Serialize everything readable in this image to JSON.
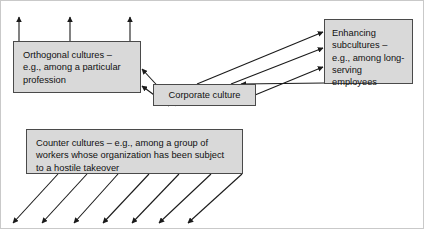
{
  "diagram": {
    "type": "relationship-diagram",
    "canvas": {
      "width": 424,
      "height": 229,
      "background": "#ffffff",
      "border_color": "#c9c9c9"
    },
    "node_style": {
      "fill": "#d9d9d9",
      "stroke": "#4a4a4a",
      "text_color": "#111111"
    },
    "arrow_color": "#1a1a1a",
    "nodes": [
      {
        "id": "orthogonal",
        "label": "Orthogonal cultures –\ne.g., among a particular\nprofession",
        "x": 12,
        "y": 40,
        "w": 128,
        "h": 52
      },
      {
        "id": "corporate",
        "label": "Corporate culture",
        "x": 152,
        "y": 83,
        "w": 103,
        "h": 22
      },
      {
        "id": "enhancing",
        "label": "Enhancing\nsubcultures  –\ne.g., among long-\nserving employees",
        "x": 323,
        "y": 18,
        "w": 89,
        "h": 65
      },
      {
        "id": "counter",
        "label": "Counter cultures – e.g., among a group of\nworkers whose organization has been subject\nto a hostile takeover",
        "x": 25,
        "y": 128,
        "w": 217,
        "h": 45
      }
    ],
    "edges": [
      {
        "from": "orthogonal",
        "to": "outside-up",
        "count": 3,
        "direction": "up"
      },
      {
        "from": "corporate",
        "to": "orthogonal",
        "count": 2,
        "direction": "left"
      },
      {
        "from": "corporate",
        "to": "enhancing",
        "count": 3,
        "direction": "up-right"
      },
      {
        "from": "enhancing",
        "to": "corporate",
        "count": 1,
        "direction": "down-left"
      },
      {
        "from": "counter",
        "to": "outside-down",
        "count": 7,
        "direction": "down-left"
      }
    ]
  }
}
